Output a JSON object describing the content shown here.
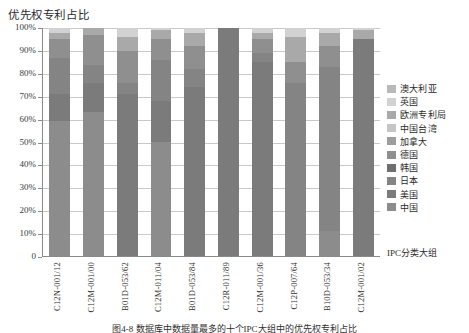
{
  "chart": {
    "title": "优先权专利占比",
    "xaxis_title": "IPC分类大组",
    "caption": "图4-8   数据库中数据量最多的十个IPC大组中的优先权专利占比"
  },
  "yaxis": {
    "ticks": [
      "100%",
      "90%",
      "80%",
      "70%",
      "60%",
      "50%",
      "40%",
      "30%",
      "20%",
      "10%",
      "0"
    ]
  },
  "legend": {
    "items": [
      {
        "label": "澳大利亚",
        "color": "#b9b9b9"
      },
      {
        "label": "英国",
        "color": "#d2d2d2"
      },
      {
        "label": "欧洲专利局",
        "color": "#a9a9a9"
      },
      {
        "label": "中国台湾",
        "color": "#c6c6c6"
      },
      {
        "label": "加拿大",
        "color": "#9e9e9e"
      },
      {
        "label": "德国",
        "color": "#8f8f8f"
      },
      {
        "label": "韩国",
        "color": "#6e6e6e"
      },
      {
        "label": "日本",
        "color": "#848484"
      },
      {
        "label": "美国",
        "color": "#7b7b7b"
      },
      {
        "label": "中国",
        "color": "#8c8c8c"
      }
    ]
  },
  "chart_data": {
    "type": "bar",
    "subtype": "stacked-100-percent",
    "title": "优先权专利占比",
    "xlabel": "IPC分类大组",
    "ylabel": "",
    "ylim": [
      0,
      100
    ],
    "ytick_interval": 10,
    "grid": true,
    "legend_position": "right",
    "categories": [
      "C12N-001/12",
      "C12M-001/00",
      "B01D-053/62",
      "C12M-011/04",
      "B01D-053/84",
      "C12R-011/89",
      "C12M-001/36",
      "C12P-007/64",
      "B10D-053/34",
      "C12M-001/02"
    ],
    "series": [
      {
        "name": "中国",
        "color": "#8c8c8c",
        "values": [
          59,
          63,
          0,
          50,
          0,
          0,
          0,
          0,
          11,
          0
        ]
      },
      {
        "name": "美国",
        "color": "#7b7b7b",
        "values": [
          12,
          13,
          71,
          18,
          74,
          100,
          85,
          0,
          0,
          95
        ]
      },
      {
        "name": "日本",
        "color": "#848484",
        "values": [
          16,
          8,
          5,
          18,
          8,
          0,
          4,
          76,
          72,
          0
        ]
      },
      {
        "name": "韩国",
        "color": "#6e6e6e",
        "values": [
          0,
          0,
          0,
          0,
          0,
          0,
          0,
          0,
          0,
          0
        ]
      },
      {
        "name": "德国",
        "color": "#8f8f8f",
        "values": [
          8,
          13,
          14,
          9,
          10,
          0,
          6,
          9,
          9,
          0
        ]
      },
      {
        "name": "加拿大",
        "color": "#9e9e9e",
        "values": [
          0,
          0,
          0,
          0,
          0,
          0,
          0,
          0,
          0,
          0
        ]
      },
      {
        "name": "中国台湾",
        "color": "#c6c6c6",
        "values": [
          0,
          0,
          0,
          0,
          0,
          0,
          0,
          0,
          0,
          0
        ]
      },
      {
        "name": "欧洲专利局",
        "color": "#a9a9a9",
        "values": [
          3,
          3,
          6,
          4,
          6,
          0,
          3,
          11,
          6,
          4
        ]
      },
      {
        "name": "英国",
        "color": "#d2d2d2",
        "values": [
          2,
          0,
          4,
          1,
          2,
          0,
          2,
          4,
          2,
          1
        ]
      },
      {
        "name": "澳大利亚",
        "color": "#b9b9b9",
        "values": [
          0,
          0,
          0,
          0,
          0,
          0,
          0,
          0,
          0,
          0
        ]
      }
    ]
  }
}
